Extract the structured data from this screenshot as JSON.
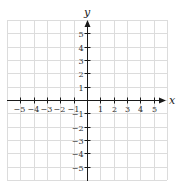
{
  "chart_data": {
    "type": "scatter",
    "title": "",
    "xlabel": "x",
    "ylabel": "y",
    "xlim": [
      -6,
      6
    ],
    "ylim": [
      -6,
      6
    ],
    "grid": true,
    "x_ticks": [
      -5,
      -4,
      -3,
      -2,
      -1,
      1,
      2,
      3,
      4,
      5
    ],
    "y_ticks": [
      5,
      4,
      3,
      2,
      1,
      -1,
      -2,
      -3,
      -4,
      -5
    ],
    "x_tick_labels": [
      "−5",
      "−4",
      "−3",
      "−2",
      "−1",
      "1",
      "2",
      "3",
      "4",
      "5"
    ],
    "y_tick_labels": [
      "5",
      "4",
      "3",
      "2",
      "1",
      "−1",
      "−2",
      "−3",
      "−4",
      "−5"
    ],
    "series": [],
    "legend": null
  },
  "colors": {
    "grid": "#dcdcdc",
    "axis": "#1a1a1a",
    "text": "#333333"
  }
}
